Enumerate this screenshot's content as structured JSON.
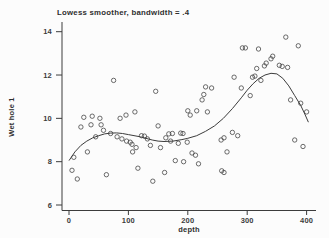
{
  "colors": {
    "ink": "#3c3c3c",
    "background": "#fcfcfc"
  },
  "chart_data": {
    "type": "scatter",
    "title": "Lowess smoother, bandwidth = .4",
    "xlabel": "depth",
    "ylabel": "Wet hole 1",
    "xlim": [
      0,
      400
    ],
    "ylim": [
      6,
      14
    ],
    "x_ticks": [
      0,
      100,
      200,
      300,
      400
    ],
    "y_ticks": [
      6,
      8,
      10,
      12,
      14
    ],
    "grid": false,
    "legend": "none",
    "marker": "open-circle",
    "series": [
      {
        "name": "observations",
        "type": "scatter",
        "points": [
          [
            5,
            7.6
          ],
          [
            8,
            8.2
          ],
          [
            14,
            7.2
          ],
          [
            20,
            9.6
          ],
          [
            25,
            10.05
          ],
          [
            31,
            8.45
          ],
          [
            37,
            9.7
          ],
          [
            39,
            10.1
          ],
          [
            45,
            9.15
          ],
          [
            52,
            10.0
          ],
          [
            54,
            9.7
          ],
          [
            58,
            9.45
          ],
          [
            63,
            7.4
          ],
          [
            70,
            9.3
          ],
          [
            75,
            11.75
          ],
          [
            81,
            9.15
          ],
          [
            86,
            10.0
          ],
          [
            89,
            9.05
          ],
          [
            96,
            10.15
          ],
          [
            97,
            8.95
          ],
          [
            103,
            8.9
          ],
          [
            106,
            8.8
          ],
          [
            107,
            8.45
          ],
          [
            111,
            10.3
          ],
          [
            113,
            8.65
          ],
          [
            116,
            7.7
          ],
          [
            122,
            9.2
          ],
          [
            127,
            9.18
          ],
          [
            132,
            9.05
          ],
          [
            137,
            8.75
          ],
          [
            141,
            7.1
          ],
          [
            146,
            11.25
          ],
          [
            150,
            9.65
          ],
          [
            154,
            8.65
          ],
          [
            161,
            7.5
          ],
          [
            163,
            9.1
          ],
          [
            168,
            9.28
          ],
          [
            171,
            8.95
          ],
          [
            174,
            9.3
          ],
          [
            179,
            8.05
          ],
          [
            184,
            8.85
          ],
          [
            188,
            9.32
          ],
          [
            192,
            9.3
          ],
          [
            193,
            8.0
          ],
          [
            199,
            8.9
          ],
          [
            200,
            10.35
          ],
          [
            204,
            10.15
          ],
          [
            207,
            8.4
          ],
          [
            213,
            8.3
          ],
          [
            215,
            10.35
          ],
          [
            218,
            7.9
          ],
          [
            224,
            10.85
          ],
          [
            227,
            11.1
          ],
          [
            230,
            11.45
          ],
          [
            233,
            10.3
          ],
          [
            240,
            11.4
          ],
          [
            256,
            9.0
          ],
          [
            261,
            9.1
          ],
          [
            257,
            7.58
          ],
          [
            261,
            7.5
          ],
          [
            266,
            8.45
          ],
          [
            275,
            9.35
          ],
          [
            284,
            9.2
          ],
          [
            278,
            11.9
          ],
          [
            290,
            11.4
          ],
          [
            292,
            13.25
          ],
          [
            297,
            13.25
          ],
          [
            305,
            11.05
          ],
          [
            309,
            11.9
          ],
          [
            313,
            11.95
          ],
          [
            316,
            12.3
          ],
          [
            319,
            13.2
          ],
          [
            323,
            11.75
          ],
          [
            329,
            12.42
          ],
          [
            332,
            12.55
          ],
          [
            340,
            12.75
          ],
          [
            343,
            12.87
          ],
          [
            354,
            12.45
          ],
          [
            359,
            12.4
          ],
          [
            365,
            13.75
          ],
          [
            368,
            12.35
          ],
          [
            373,
            10.85
          ],
          [
            380,
            9.0
          ],
          [
            386,
            13.35
          ],
          [
            390,
            10.7
          ],
          [
            394,
            8.7
          ],
          [
            400,
            10.3
          ]
        ]
      },
      {
        "name": "lowess-smoother",
        "type": "line",
        "points": [
          [
            0,
            8.05
          ],
          [
            10,
            8.45
          ],
          [
            20,
            8.75
          ],
          [
            30,
            8.95
          ],
          [
            40,
            9.1
          ],
          [
            50,
            9.2
          ],
          [
            60,
            9.28
          ],
          [
            70,
            9.32
          ],
          [
            80,
            9.33
          ],
          [
            90,
            9.3
          ],
          [
            100,
            9.25
          ],
          [
            120,
            9.15
          ],
          [
            140,
            9.0
          ],
          [
            150,
            8.95
          ],
          [
            160,
            8.93
          ],
          [
            175,
            8.95
          ],
          [
            190,
            9.02
          ],
          [
            200,
            9.08
          ],
          [
            215,
            9.2
          ],
          [
            230,
            9.4
          ],
          [
            245,
            9.65
          ],
          [
            260,
            10.0
          ],
          [
            275,
            10.45
          ],
          [
            290,
            10.95
          ],
          [
            300,
            11.3
          ],
          [
            310,
            11.6
          ],
          [
            320,
            11.85
          ],
          [
            330,
            12.0
          ],
          [
            340,
            12.08
          ],
          [
            350,
            12.05
          ],
          [
            360,
            11.85
          ],
          [
            370,
            11.5
          ],
          [
            380,
            11.05
          ],
          [
            390,
            10.6
          ],
          [
            397,
            10.2
          ],
          [
            403,
            9.82
          ]
        ]
      }
    ]
  }
}
